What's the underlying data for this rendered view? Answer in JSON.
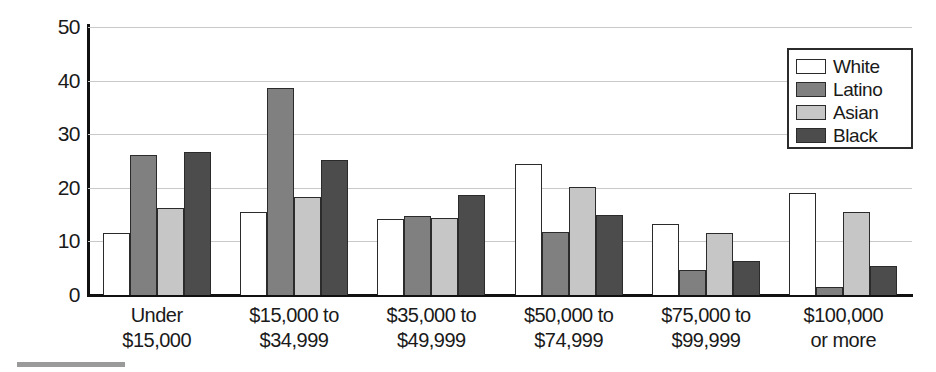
{
  "chart_data": {
    "type": "bar",
    "title": "",
    "xlabel": "",
    "ylabel": "Percentage",
    "ylim": [
      0,
      50
    ],
    "yticks": [
      0,
      10,
      20,
      30,
      40,
      50
    ],
    "ytick_labels": [
      "0",
      "10",
      "20",
      "30",
      "40",
      "50"
    ],
    "grid": true,
    "legend_position": "top-right",
    "categories": [
      "Under $15,000",
      "$15,000 to $34,999",
      "$35,000 to $49,999",
      "$50,000 to $74,999",
      "$75,000 to $99,999",
      "$100,000 or more"
    ],
    "category_lines": [
      {
        "line1": "Under",
        "line2": "$15,000"
      },
      {
        "line1": "$15,000 to",
        "line2": "$34,999"
      },
      {
        "line1": "$35,000 to",
        "line2": "$49,999"
      },
      {
        "line1": "$50,000 to",
        "line2": "$74,999"
      },
      {
        "line1": "$75,000 to",
        "line2": "$99,999"
      },
      {
        "line1": "$100,000",
        "line2": "or more"
      }
    ],
    "series": [
      {
        "name": "White",
        "key": "white",
        "color": "#ffffff",
        "values": [
          11.5,
          15.4,
          14.1,
          24.4,
          13.2,
          19.1
        ]
      },
      {
        "name": "Latino",
        "key": "latino",
        "color": "#808080",
        "values": [
          26.2,
          38.6,
          14.7,
          11.8,
          4.7,
          1.5
        ]
      },
      {
        "name": "Asian",
        "key": "asian",
        "color": "#c6c6c6",
        "values": [
          16.3,
          18.3,
          14.3,
          20.2,
          11.6,
          15.4
        ]
      },
      {
        "name": "Black",
        "key": "black",
        "color": "#4c4c4c",
        "values": [
          26.7,
          25.1,
          18.6,
          14.9,
          6.4,
          5.5
        ]
      }
    ]
  },
  "axis": {
    "y_title": "Percentage"
  },
  "legend": {
    "entries": [
      {
        "label": "White",
        "key": "white"
      },
      {
        "label": "Latino",
        "key": "latino"
      },
      {
        "label": "Asian",
        "key": "asian"
      },
      {
        "label": "Black",
        "key": "black"
      }
    ]
  }
}
